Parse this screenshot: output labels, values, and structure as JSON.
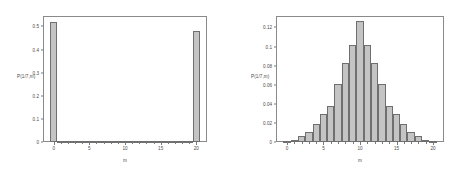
{
  "figure": {
    "background_color": "#ffffff",
    "bar_fill_color": "#c4c4c4",
    "bar_border_color": "#6f6f6f",
    "axis_color": "#8a8a8a",
    "text_color": "#4a4a4a"
  },
  "chart_data": [
    {
      "type": "bar",
      "panel": "left",
      "title": "",
      "xlabel": "m",
      "ylabel": "P(1/7,m)",
      "categories": [
        0,
        1,
        2,
        3,
        4,
        5,
        6,
        7,
        8,
        9,
        10,
        11,
        12,
        13,
        14,
        15,
        16,
        17,
        18,
        19,
        20
      ],
      "values": [
        0.52,
        0.004,
        0.001,
        0.0005,
        0.0003,
        0.0002,
        0.0002,
        0.0002,
        0.0002,
        0.0002,
        0.0002,
        0.0002,
        0.0002,
        0.0002,
        0.0002,
        0.0002,
        0.0003,
        0.0005,
        0.001,
        0.004,
        0.48
      ],
      "xlim": [
        -1.5,
        21.5
      ],
      "ylim": [
        0,
        0.545
      ],
      "xticks": [
        0,
        5,
        10,
        15,
        20
      ],
      "xtick_labels": [
        "0",
        "5",
        "10",
        "15",
        "20"
      ],
      "yticks": [
        0,
        0.1,
        0.2,
        0.3,
        0.4,
        0.5
      ],
      "ytick_labels": [
        "0",
        "0.1",
        "0.2",
        "0.3",
        "0.4",
        "0.5"
      ],
      "grid": false,
      "legend": "none"
    },
    {
      "type": "bar",
      "panel": "right",
      "title": "",
      "xlabel": "m",
      "ylabel": "P(1/7,m)",
      "categories": [
        0,
        1,
        2,
        3,
        4,
        5,
        6,
        7,
        8,
        9,
        10,
        11,
        12,
        13,
        14,
        15,
        16,
        17,
        18,
        19,
        20
      ],
      "values": [
        0.0005,
        0.002,
        0.006,
        0.011,
        0.0185,
        0.0295,
        0.0375,
        0.0605,
        0.0825,
        0.1015,
        0.1265,
        0.1015,
        0.0825,
        0.0605,
        0.0375,
        0.0295,
        0.0185,
        0.011,
        0.006,
        0.002,
        0.0005
      ],
      "xlim": [
        -1.5,
        21.5
      ],
      "ylim": [
        0,
        0.132
      ],
      "xticks": [
        0,
        5,
        10,
        15,
        20
      ],
      "xtick_labels": [
        "0",
        "5",
        "10",
        "15",
        "20"
      ],
      "yticks": [
        0,
        0.02,
        0.04,
        0.06,
        0.08,
        0.1,
        0.12
      ],
      "ytick_labels": [
        "0",
        "0.02",
        "0.04",
        "0.06",
        "0.08",
        "0.1",
        "0.12"
      ],
      "grid": false,
      "legend": "none"
    }
  ]
}
